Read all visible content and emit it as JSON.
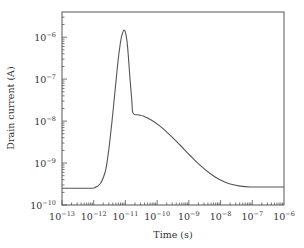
{
  "chart_data": {
    "type": "line",
    "title": "",
    "xlabel": "Time (s)",
    "ylabel": "Drain current (A)",
    "xscale": "log",
    "yscale": "log",
    "xlim_log10": [
      -13,
      -6
    ],
    "ylim_log10": [
      -10,
      -5.4
    ],
    "grid": false,
    "legend": null,
    "x_ticks": [
      {
        "base": "10",
        "exp": "−13"
      },
      {
        "base": "10",
        "exp": "−12"
      },
      {
        "base": "10",
        "exp": "−11"
      },
      {
        "base": "10",
        "exp": "−10"
      },
      {
        "base": "10",
        "exp": "−9"
      },
      {
        "base": "10",
        "exp": "−8"
      },
      {
        "base": "10",
        "exp": "−7"
      },
      {
        "base": "10",
        "exp": "−6"
      }
    ],
    "x_tick_values_log10": [
      -13,
      -12,
      -11,
      -10,
      -9,
      -8,
      -7,
      -6
    ],
    "y_ticks": [
      {
        "base": "10",
        "exp": "−10"
      },
      {
        "base": "10",
        "exp": "−9"
      },
      {
        "base": "10",
        "exp": "−8"
      },
      {
        "base": "10",
        "exp": "−7"
      },
      {
        "base": "10",
        "exp": "−6"
      }
    ],
    "y_tick_values_log10": [
      -10,
      -9,
      -8,
      -7,
      -6
    ],
    "series": [
      {
        "name": "Drain current",
        "points_log10": [
          [
            -13.0,
            -9.6
          ],
          [
            -12.12,
            -9.6
          ],
          [
            -11.95,
            -9.58
          ],
          [
            -11.8,
            -9.5
          ],
          [
            -11.7,
            -9.35
          ],
          [
            -11.61,
            -9.12
          ],
          [
            -11.52,
            -8.65
          ],
          [
            -11.42,
            -7.98
          ],
          [
            -11.33,
            -7.3
          ],
          [
            -11.23,
            -6.55
          ],
          [
            -11.14,
            -6.05
          ],
          [
            -11.08,
            -5.88
          ],
          [
            -11.04,
            -5.83
          ],
          [
            -11.0,
            -5.88
          ],
          [
            -10.95,
            -6.1
          ],
          [
            -10.91,
            -6.43
          ],
          [
            -10.86,
            -6.95
          ],
          [
            -10.8,
            -7.5
          ],
          [
            -10.76,
            -7.81
          ],
          [
            -10.6,
            -7.85
          ],
          [
            -10.44,
            -7.88
          ],
          [
            -10.2,
            -7.97
          ],
          [
            -9.91,
            -8.12
          ],
          [
            -9.6,
            -8.33
          ],
          [
            -9.28,
            -8.57
          ],
          [
            -8.96,
            -8.82
          ],
          [
            -8.65,
            -9.05
          ],
          [
            -8.33,
            -9.25
          ],
          [
            -8.02,
            -9.4
          ],
          [
            -7.7,
            -9.5
          ],
          [
            -7.38,
            -9.55
          ],
          [
            -7.07,
            -9.57
          ],
          [
            -6.5,
            -9.57
          ],
          [
            -6.0,
            -9.57
          ]
        ]
      }
    ]
  }
}
